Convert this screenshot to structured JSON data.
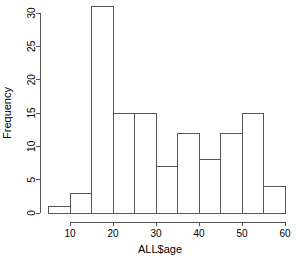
{
  "chart_data": {
    "type": "bar",
    "title": "",
    "subtitle": "",
    "xlabel": "ALL$age",
    "ylabel": "Frequency",
    "grid": false,
    "legend": null,
    "legend_position": "none",
    "xlim": [
      5,
      60
    ],
    "ylim": [
      0,
      31
    ],
    "xticks": [
      10,
      20,
      30,
      40,
      50,
      60
    ],
    "xtick_labels": [
      "10",
      "20",
      "30",
      "40",
      "50",
      "60"
    ],
    "yticks": [
      0,
      5,
      10,
      15,
      20,
      25,
      30
    ],
    "ytick_labels": [
      "0",
      "5",
      "10",
      "15",
      "20",
      "25",
      "30"
    ],
    "bin_width": 5,
    "bin_edges": [
      5,
      10,
      15,
      20,
      25,
      30,
      35,
      40,
      45,
      50,
      55,
      60
    ],
    "categories": [
      "5-10",
      "10-15",
      "15-20",
      "20-25",
      "25-30",
      "30-35",
      "35-40",
      "40-45",
      "45-50",
      "50-55",
      "55-60"
    ],
    "values": [
      1,
      3,
      31,
      15,
      15,
      7,
      12,
      8,
      12,
      15,
      4
    ],
    "bar_fill": "#ffffff",
    "bar_stroke": "#555555",
    "axis_color": "#555555"
  },
  "axes": {
    "x_title": "ALL$age",
    "y_title": "Frequency"
  }
}
